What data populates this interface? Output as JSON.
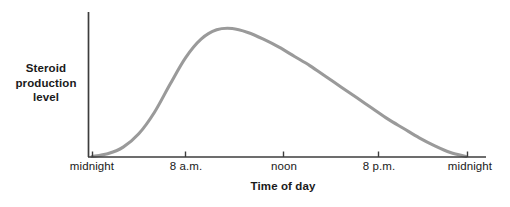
{
  "chart_data": {
    "type": "line",
    "title": "",
    "xlabel": "Time of day",
    "ylabel": "Steroid production level",
    "grid": false,
    "legend": "none",
    "xlim": [
      0,
      24
    ],
    "ylim": [
      0,
      100
    ],
    "x_tick_labels": [
      "midnight",
      "8 a.m.",
      "noon",
      "8 p.m.",
      "midnight"
    ],
    "x_tick_values": [
      0,
      8,
      12,
      20,
      24
    ],
    "y_tick_labels": [],
    "series": [
      {
        "name": "Steroid production level",
        "color": "#9a9a9a",
        "x": [
          0,
          1,
          2,
          3,
          4,
          5,
          6,
          7,
          8,
          9,
          10,
          11,
          12,
          13,
          14,
          15,
          16,
          17,
          18,
          19,
          20,
          21,
          22,
          23,
          24
        ],
        "values": [
          0,
          2,
          7,
          17,
          33,
          54,
          74,
          88,
          95,
          96,
          93,
          88,
          82,
          75,
          68,
          60,
          52,
          44,
          36,
          28,
          21,
          14,
          8,
          3,
          0
        ]
      }
    ],
    "annotations": []
  },
  "axis": {
    "y_label_line1": "Steroid",
    "y_label_line2": "production",
    "y_label_line3": "level",
    "x_label": "Time of day",
    "axis_color": "#3d3d3d",
    "curve_color": "#9a9a9a"
  },
  "ticks": [
    {
      "label": "midnight"
    },
    {
      "label": "8 a.m."
    },
    {
      "label": "noon"
    },
    {
      "label": "8 p.m."
    },
    {
      "label": "midnight"
    }
  ]
}
